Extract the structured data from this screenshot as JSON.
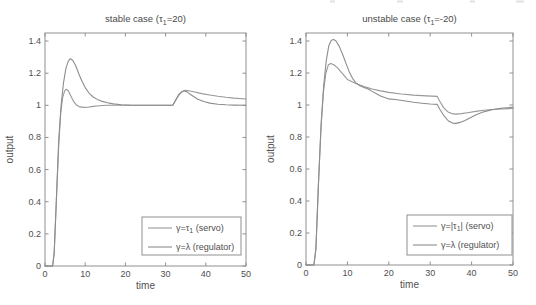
{
  "figure": {
    "background": "#ffffff",
    "text_color": "#4f4f4f",
    "axis_color": "#909090"
  },
  "artifacts": {
    "description": "faint cut-off text fragments along top edge",
    "color": "#c6c6c6",
    "marks": [
      {
        "x": 330,
        "w": 5
      },
      {
        "x": 397,
        "w": 6
      },
      {
        "x": 470,
        "w": 5
      },
      {
        "x": 516,
        "w": 8
      }
    ]
  },
  "chart_data": [
    {
      "type": "line",
      "title": {
        "pre": "stable case (τ",
        "sub": "1",
        "post": "=20)"
      },
      "xlabel": "time",
      "ylabel": "output",
      "xlim": [
        0,
        50
      ],
      "ylim": [
        0,
        1.45
      ],
      "xticks": [
        0,
        10,
        20,
        30,
        40,
        50
      ],
      "xtick_labels": [
        "0",
        "10",
        "20",
        "30",
        "40",
        "50"
      ],
      "yticks": [
        0,
        0.2,
        0.4,
        0.6,
        0.8,
        1,
        1.2,
        1.4
      ],
      "ytick_labels": [
        "0",
        "0.2",
        "0.4",
        "0.6",
        "0.8",
        "1",
        "1.2",
        "1.4"
      ],
      "grid": false,
      "box": {
        "left": 45,
        "top": 33,
        "right": 246,
        "bottom": 266
      },
      "legend": {
        "position": "lower-right",
        "left": 142,
        "top": 217,
        "width": 99,
        "height": 38,
        "entries": [
          {
            "pre": "γ=τ",
            "sub": "1",
            "post": " (servo)"
          },
          {
            "pre": "γ=λ",
            "sub": "",
            "post": " (regulator)"
          }
        ]
      },
      "series": [
        {
          "name": "servo",
          "color": "#989898",
          "points": [
            [
              0,
              0
            ],
            [
              1.9,
              0
            ],
            [
              2.3,
              0.08
            ],
            [
              2.8,
              0.4
            ],
            [
              3.4,
              0.75
            ],
            [
              3.9,
              0.95
            ],
            [
              4.4,
              1.05
            ],
            [
              4.9,
              1.09
            ],
            [
              5.3,
              1.1
            ],
            [
              5.8,
              1.09
            ],
            [
              6.4,
              1.06
            ],
            [
              7.1,
              1.025
            ],
            [
              7.9,
              1.0
            ],
            [
              8.7,
              0.99
            ],
            [
              9.6,
              0.987
            ],
            [
              10.6,
              0.988
            ],
            [
              12,
              0.993
            ],
            [
              13.5,
              0.997
            ],
            [
              15.5,
              1.0
            ],
            [
              20,
              1.0
            ],
            [
              31.8,
              1.0
            ],
            [
              32.4,
              1.025
            ],
            [
              33.2,
              1.06
            ],
            [
              34,
              1.083
            ],
            [
              34.8,
              1.093
            ],
            [
              35.8,
              1.09
            ],
            [
              37,
              1.084
            ],
            [
              39,
              1.073
            ],
            [
              41,
              1.064
            ],
            [
              43,
              1.056
            ],
            [
              45,
              1.05
            ],
            [
              47,
              1.045
            ],
            [
              50,
              1.039
            ]
          ]
        },
        {
          "name": "regulator",
          "color": "#8d8d8d",
          "points": [
            [
              0,
              0
            ],
            [
              1.9,
              0
            ],
            [
              2.3,
              0.08
            ],
            [
              2.8,
              0.4
            ],
            [
              3.4,
              0.78
            ],
            [
              4,
              1.0
            ],
            [
              4.6,
              1.14
            ],
            [
              5.2,
              1.23
            ],
            [
              5.8,
              1.275
            ],
            [
              6.3,
              1.29
            ],
            [
              6.9,
              1.28
            ],
            [
              7.6,
              1.248
            ],
            [
              8.4,
              1.197
            ],
            [
              9.2,
              1.15
            ],
            [
              10,
              1.11
            ],
            [
              11,
              1.075
            ],
            [
              12,
              1.052
            ],
            [
              13,
              1.037
            ],
            [
              14,
              1.026
            ],
            [
              15.5,
              1.016
            ],
            [
              17,
              1.009
            ],
            [
              19,
              1.004
            ],
            [
              21,
              1.001
            ],
            [
              24,
              1.0
            ],
            [
              31.8,
              1.0
            ],
            [
              32.4,
              1.028
            ],
            [
              33.2,
              1.065
            ],
            [
              34,
              1.085
            ],
            [
              34.6,
              1.09
            ],
            [
              35.4,
              1.082
            ],
            [
              36.5,
              1.062
            ],
            [
              38,
              1.038
            ],
            [
              39.5,
              1.024
            ],
            [
              41,
              1.014
            ],
            [
              43,
              1.007
            ],
            [
              45,
              1.003
            ],
            [
              47,
              1.001
            ],
            [
              50,
              1.0
            ]
          ]
        }
      ]
    },
    {
      "type": "line",
      "title": {
        "pre": "unstable case (τ",
        "sub": "1",
        "post": "=-20)"
      },
      "xlabel": "time",
      "ylabel": "output",
      "xlim": [
        0,
        50
      ],
      "ylim": [
        0,
        1.45
      ],
      "xticks": [
        0,
        10,
        20,
        30,
        40,
        50
      ],
      "xtick_labels": [
        "0",
        "10",
        "20",
        "30",
        "40",
        "50"
      ],
      "yticks": [
        0,
        0.2,
        0.4,
        0.6,
        0.8,
        1,
        1.2,
        1.4
      ],
      "ytick_labels": [
        "0",
        "0.2",
        "0.4",
        "0.6",
        "0.8",
        "1",
        "1.2",
        "1.4"
      ],
      "grid": false,
      "box": {
        "left": 306,
        "top": 33,
        "right": 513,
        "bottom": 265
      },
      "legend": {
        "position": "lower-right",
        "left": 407,
        "top": 215,
        "width": 105,
        "height": 40,
        "entries": [
          {
            "pre": "γ=|τ",
            "sub": "1",
            "post": "| (servo)"
          },
          {
            "pre": "γ=λ",
            "sub": "",
            "post": " (regulator)"
          }
        ]
      },
      "series": [
        {
          "name": "servo",
          "color": "#989898",
          "points": [
            [
              0,
              0
            ],
            [
              1.9,
              0
            ],
            [
              2.4,
              0.1
            ],
            [
              3,
              0.5
            ],
            [
              3.6,
              0.85
            ],
            [
              4.2,
              1.08
            ],
            [
              4.8,
              1.2
            ],
            [
              5.4,
              1.252
            ],
            [
              6,
              1.26
            ],
            [
              6.7,
              1.252
            ],
            [
              7.5,
              1.235
            ],
            [
              8.5,
              1.205
            ],
            [
              10,
              1.16
            ],
            [
              12,
              1.135
            ],
            [
              14,
              1.115
            ],
            [
              16,
              1.1
            ],
            [
              18,
              1.088
            ],
            [
              20,
              1.079
            ],
            [
              23,
              1.069
            ],
            [
              26,
              1.062
            ],
            [
              29,
              1.057
            ],
            [
              31.7,
              1.054
            ],
            [
              32.4,
              1.02
            ],
            [
              33.2,
              0.985
            ],
            [
              34.2,
              0.958
            ],
            [
              35.2,
              0.946
            ],
            [
              36.2,
              0.943
            ],
            [
              37.5,
              0.946
            ],
            [
              39,
              0.952
            ],
            [
              41,
              0.96
            ],
            [
              43,
              0.967
            ],
            [
              45,
              0.972
            ],
            [
              47,
              0.975
            ],
            [
              50,
              0.978
            ]
          ]
        },
        {
          "name": "regulator",
          "color": "#8d8d8d",
          "points": [
            [
              0,
              0
            ],
            [
              1.9,
              0
            ],
            [
              2.4,
              0.1
            ],
            [
              3,
              0.5
            ],
            [
              3.7,
              0.9
            ],
            [
              4.3,
              1.13
            ],
            [
              4.9,
              1.28
            ],
            [
              5.5,
              1.37
            ],
            [
              6.1,
              1.405
            ],
            [
              6.7,
              1.41
            ],
            [
              7.3,
              1.398
            ],
            [
              8,
              1.368
            ],
            [
              8.8,
              1.32
            ],
            [
              9.6,
              1.265
            ],
            [
              10.4,
              1.21
            ],
            [
              11.2,
              1.168
            ],
            [
              12,
              1.14
            ],
            [
              13,
              1.12
            ],
            [
              14,
              1.11
            ],
            [
              15,
              1.1
            ],
            [
              16,
              1.085
            ],
            [
              17,
              1.07
            ],
            [
              18,
              1.056
            ],
            [
              19,
              1.046
            ],
            [
              20,
              1.038
            ],
            [
              22,
              1.033
            ],
            [
              24,
              1.025
            ],
            [
              26,
              1.017
            ],
            [
              28,
              1.011
            ],
            [
              30,
              1.006
            ],
            [
              31.7,
              1.004
            ],
            [
              32.4,
              0.97
            ],
            [
              33.4,
              0.93
            ],
            [
              34.4,
              0.9
            ],
            [
              35.4,
              0.887
            ],
            [
              36.2,
              0.885
            ],
            [
              37.2,
              0.891
            ],
            [
              38.4,
              0.904
            ],
            [
              39.8,
              0.922
            ],
            [
              41.2,
              0.941
            ],
            [
              42.6,
              0.955
            ],
            [
              44,
              0.965
            ],
            [
              45.5,
              0.973
            ],
            [
              47,
              0.979
            ],
            [
              48.5,
              0.983
            ],
            [
              50,
              0.986
            ]
          ]
        }
      ]
    }
  ]
}
